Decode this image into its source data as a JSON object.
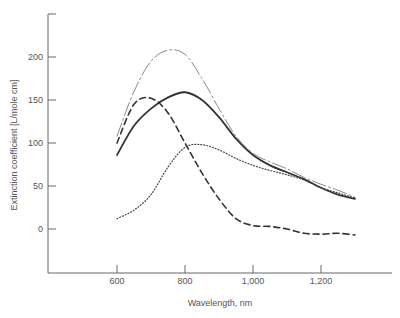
{
  "chart_data": {
    "type": "line",
    "title": "",
    "xlabel": "Wavelength, nm",
    "ylabel": "Extinction coefficient [L/mole cm]",
    "xlim": [
      440,
      1340
    ],
    "ylim": [
      -50,
      250
    ],
    "xticks": [
      600,
      800,
      1000,
      1200
    ],
    "xtick_labels": [
      "600",
      "800",
      "1,000",
      "1,200"
    ],
    "yticks": [
      0,
      50,
      100,
      150,
      200
    ],
    "ytick_labels": [
      "0",
      "50",
      "100",
      "150",
      "200"
    ],
    "grid": false,
    "legend": null,
    "series": [
      {
        "name": "solid",
        "style": "solid",
        "x": [
          600,
          650,
          700,
          750,
          800,
          850,
          900,
          950,
          1000,
          1050,
          1100,
          1150,
          1200,
          1250,
          1300
        ],
        "values": [
          86,
          120,
          140,
          153,
          159,
          150,
          130,
          105,
          86,
          74,
          66,
          58,
          48,
          40,
          35
        ]
      },
      {
        "name": "dash-dot",
        "style": "dashdot",
        "x": [
          600,
          650,
          700,
          750,
          800,
          850,
          900,
          950,
          1000,
          1050,
          1100,
          1150,
          1200,
          1250,
          1300
        ],
        "values": [
          108,
          160,
          195,
          208,
          203,
          175,
          140,
          108,
          88,
          78,
          70,
          60,
          52,
          45,
          37
        ]
      },
      {
        "name": "dashed",
        "style": "dashed",
        "x": [
          600,
          650,
          700,
          750,
          800,
          850,
          900,
          950,
          1000,
          1050,
          1100,
          1150,
          1200,
          1250,
          1300
        ],
        "values": [
          100,
          145,
          152,
          135,
          100,
          65,
          35,
          12,
          4,
          3,
          0,
          -5,
          -6,
          -5,
          -7
        ]
      },
      {
        "name": "dotted",
        "style": "dotted",
        "x": [
          600,
          650,
          700,
          750,
          800,
          850,
          900,
          950,
          1000,
          1050,
          1100,
          1150,
          1200,
          1250,
          1300
        ],
        "values": [
          12,
          22,
          40,
          72,
          95,
          98,
          92,
          82,
          74,
          68,
          63,
          57,
          48,
          42,
          36
        ]
      }
    ]
  }
}
